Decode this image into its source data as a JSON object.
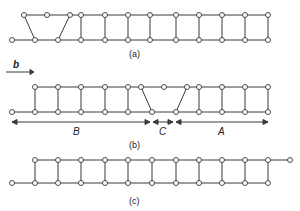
{
  "figure": {
    "panels": [
      {
        "id": "a",
        "label": "(a)",
        "description": "Ladder with shear/slip defect at left end"
      },
      {
        "id": "b",
        "label": "(b)",
        "description": "Ladder with defect region C between regions B and A",
        "regions": [
          {
            "name": "B"
          },
          {
            "name": "C"
          },
          {
            "name": "A"
          }
        ]
      },
      {
        "id": "c",
        "label": "(c)",
        "description": "Perfect ladder displaced by one unit"
      }
    ],
    "direction_label": "b",
    "colors": {
      "line": "#3a3a3a",
      "node_fill": "#ffffff",
      "background": "#ffffff"
    }
  }
}
